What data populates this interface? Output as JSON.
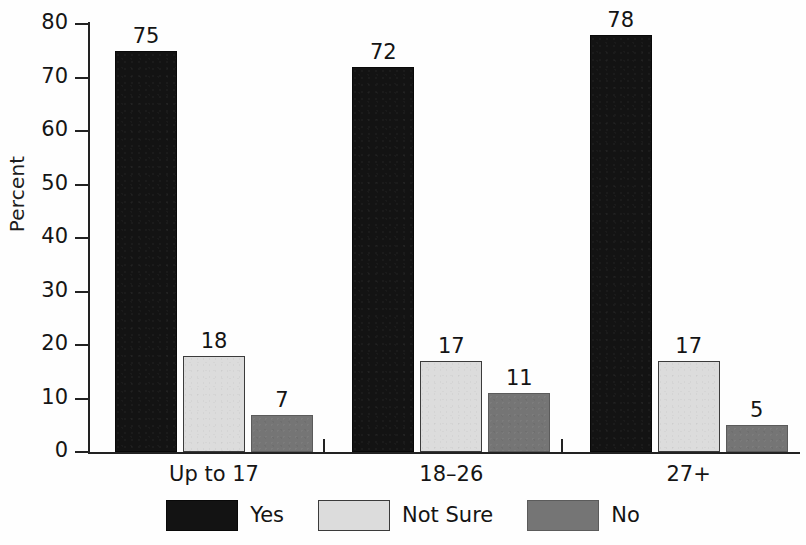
{
  "chart_data": {
    "type": "bar",
    "title": "",
    "subtitle": "",
    "xlabel": "",
    "ylabel": "Percent",
    "ylim": [
      0,
      80
    ],
    "ytick_step": 10,
    "yticks": [
      80,
      70,
      60,
      50,
      40,
      30,
      20,
      10,
      0
    ],
    "grid": false,
    "legend_position": "bottom",
    "categories": [
      "Up to 17",
      "18–26",
      "27+"
    ],
    "series": [
      {
        "name": "Yes",
        "color": "#131313",
        "values": [
          75,
          18,
          7
        ]
      },
      {
        "name": "Not Sure",
        "color": "#dcdcdc",
        "values": [
          72,
          17,
          11
        ]
      },
      {
        "name": "No",
        "color": "#757575",
        "values": [
          78,
          17,
          5
        ]
      }
    ],
    "groups": [
      {
        "label": "Up to 17",
        "bars": [
          {
            "series": "Yes",
            "value": 75,
            "value_label": "75"
          },
          {
            "series": "Not Sure",
            "value": 18,
            "value_label": "18"
          },
          {
            "series": "No",
            "value": 7,
            "value_label": "7"
          }
        ]
      },
      {
        "label": "18–26",
        "bars": [
          {
            "series": "Yes",
            "value": 72,
            "value_label": "72"
          },
          {
            "series": "Not Sure",
            "value": 17,
            "value_label": "17"
          },
          {
            "series": "No",
            "value": 11,
            "value_label": "11"
          }
        ]
      },
      {
        "label": "27+",
        "bars": [
          {
            "series": "Yes",
            "value": 78,
            "value_label": "78"
          },
          {
            "series": "Not Sure",
            "value": 17,
            "value_label": "17"
          },
          {
            "series": "No",
            "value": 5,
            "value_label": "5"
          }
        ]
      }
    ]
  },
  "axis": {
    "y_title": "Percent",
    "y_tick_labels": [
      "80",
      "70",
      "60",
      "50",
      "40",
      "30",
      "20",
      "10",
      "0"
    ]
  },
  "legend": {
    "items": [
      {
        "label": "Yes",
        "series_key": "yes"
      },
      {
        "label": "Not Sure",
        "series_key": "notsure"
      },
      {
        "label": "No",
        "series_key": "no"
      }
    ]
  },
  "colors": {
    "yes": "#131313",
    "not_sure": "#dcdcdc",
    "no": "#757575",
    "axis": "#222222",
    "text": "#141414",
    "background": "#fefefe"
  }
}
